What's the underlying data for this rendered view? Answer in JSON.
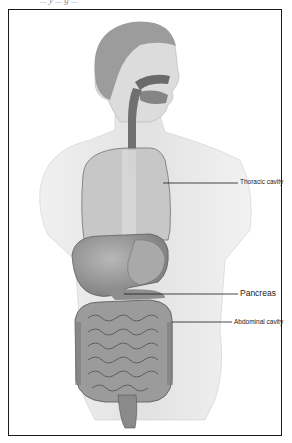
{
  "figure": {
    "caption_partial": "... y ... g ...",
    "colors": {
      "frame": "#1a1a1a",
      "organ_dark": "#6e6e6e",
      "organ_mid": "#9a9a9a",
      "organ_light": "#c8c8c8",
      "skin": "#e6e6e6",
      "background": "#ffffff"
    },
    "labels": [
      {
        "id": "thoracic",
        "text": "Thoracic cavity"
      },
      {
        "id": "pancreas",
        "text": "Pancreas"
      },
      {
        "id": "abdominal",
        "text": "Abdominal cavity"
      }
    ]
  }
}
